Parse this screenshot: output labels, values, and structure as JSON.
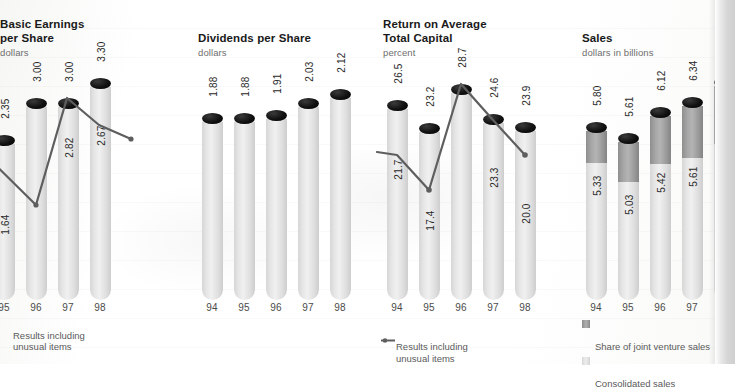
{
  "page": {
    "background_color": "#ffffff",
    "bar_fill_color": "#e4e4e4",
    "bar_cap_color": "#111111",
    "joint_venture_color": "#a2a2a2",
    "line_color": "#5e5e5e"
  },
  "charts": [
    {
      "id": "basic-earnings-per-share",
      "title": "Basic Earnings\nper Share",
      "subtitle": "dollars",
      "type": "bar",
      "unit": "dollars",
      "categories": [
        "94",
        "95",
        "96",
        "97",
        "98"
      ],
      "first_category_clipped": true,
      "values": [
        2.35,
        3.0,
        3.0,
        3.3
      ],
      "bar_labels": [
        "",
        "2.35",
        "3.00",
        "3.00",
        "3.30"
      ],
      "series": [
        {
          "name": "Bars",
          "values": [
            null,
            2.35,
            3.0,
            3.0,
            3.3
          ]
        },
        {
          "name": "Results including unusual items",
          "values": [
            null,
            1.64,
            3.0,
            2.82,
            2.67
          ],
          "labels": [
            "",
            "1.64",
            "",
            "2.82",
            "2.67"
          ]
        }
      ],
      "legend": [
        "Results including\nunusual items"
      ],
      "legend_marker": "line-dot"
    },
    {
      "id": "dividends-per-share",
      "title": "Dividends per Share",
      "subtitle": "dollars",
      "type": "bar",
      "unit": "dollars",
      "categories": [
        "94",
        "95",
        "96",
        "97",
        "98"
      ],
      "values": [
        1.88,
        1.88,
        1.91,
        2.03,
        2.12
      ],
      "bar_labels": [
        "1.88",
        "1.88",
        "1.91",
        "2.03",
        "2.12"
      ],
      "legend": []
    },
    {
      "id": "return-on-average-total-capital",
      "title": "Return on Average\nTotal Capital",
      "subtitle": "percent",
      "type": "bar",
      "unit": "percent",
      "categories": [
        "94",
        "95",
        "96",
        "97",
        "98"
      ],
      "values": [
        26.5,
        23.2,
        28.7,
        24.6,
        23.9
      ],
      "bar_labels": [
        "26.5",
        "23.2",
        "28.7",
        "24.6",
        "23.9"
      ],
      "series": [
        {
          "name": "Results including unusual items",
          "values": [
            21.7,
            17.4,
            28.7,
            23.3,
            20.0
          ],
          "labels": [
            "21.7",
            "17.4",
            "",
            "23.3",
            "20.0"
          ]
        }
      ],
      "legend": [
        "Results including\nunusual items"
      ],
      "legend_marker": "line-dot"
    },
    {
      "id": "sales",
      "title": "Sales",
      "subtitle": "dollars in billions",
      "type": "bar",
      "unit": "dollars in billions",
      "stacked": true,
      "categories": [
        "94",
        "95",
        "96",
        "97",
        "98"
      ],
      "total_values": [
        5.8,
        5.61,
        6.12,
        6.34,
        6.81
      ],
      "total_labels": [
        "5.80",
        "5.61",
        "6.12",
        "6.34",
        "6.81"
      ],
      "consolidated_values": [
        5.33,
        5.03,
        5.42,
        5.61,
        6.03
      ],
      "consolidated_labels": [
        "5.33",
        "5.03",
        "5.42",
        "5.61",
        "6.03"
      ],
      "legend": [
        "Share of joint venture sales",
        "Consolidated sales"
      ],
      "legend_markers": [
        "swatch-dark",
        "swatch-light"
      ]
    }
  ]
}
